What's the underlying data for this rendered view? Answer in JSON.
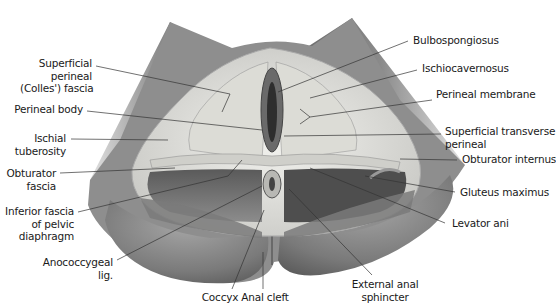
{
  "figure": {
    "colors": {
      "background": "#ffffff",
      "skin_dark": "#6e6e6e",
      "skin_mid": "#9a9a9a",
      "skin_light": "#d4d4d4",
      "fascia": "#e6e6e2",
      "muscle_dark": "#4a4a4a",
      "leader_line": "#333333",
      "label_text": "#1a1a1a"
    }
  },
  "labels": {
    "left": [
      {
        "id": "superficial-perineal-fascia",
        "lines": [
          "Superficial",
          "perineal",
          "(Colles') fascia"
        ]
      },
      {
        "id": "perineal-body",
        "lines": [
          "Perineal body"
        ]
      },
      {
        "id": "ischial-tuberosity",
        "lines": [
          "Ischial",
          "tuberosity"
        ]
      },
      {
        "id": "obturator-fascia",
        "lines": [
          "Obturator",
          "fascia"
        ]
      },
      {
        "id": "inferior-fascia-pelvic-diaphragm",
        "lines": [
          "Inferior fascia",
          "of pelvic",
          "diaphragm"
        ]
      },
      {
        "id": "anococcygeal-lig",
        "lines": [
          "Anococcygeal",
          "lig."
        ]
      }
    ],
    "right": [
      {
        "id": "bulbospongiosus",
        "lines": [
          "Bulbospongiosus"
        ]
      },
      {
        "id": "ischiocavernosus",
        "lines": [
          "Ischiocavernosus"
        ]
      },
      {
        "id": "perineal-membrane",
        "lines": [
          "Perineal membrane"
        ]
      },
      {
        "id": "superficial-transverse-perineal",
        "lines": [
          "Superficial transverse",
          "perineal"
        ]
      },
      {
        "id": "obturator-internus",
        "lines": [
          "Obturator internus"
        ]
      },
      {
        "id": "gluteus-maximus",
        "lines": [
          "Gluteus maximus"
        ]
      },
      {
        "id": "levator-ani",
        "lines": [
          "Levator ani"
        ]
      }
    ],
    "bottom": [
      {
        "id": "coccyx",
        "lines": [
          "Coccyx"
        ]
      },
      {
        "id": "anal-cleft",
        "lines": [
          "Anal cleft"
        ]
      },
      {
        "id": "external-anal-sphincter",
        "lines": [
          "External anal",
          "sphincter"
        ]
      }
    ]
  }
}
